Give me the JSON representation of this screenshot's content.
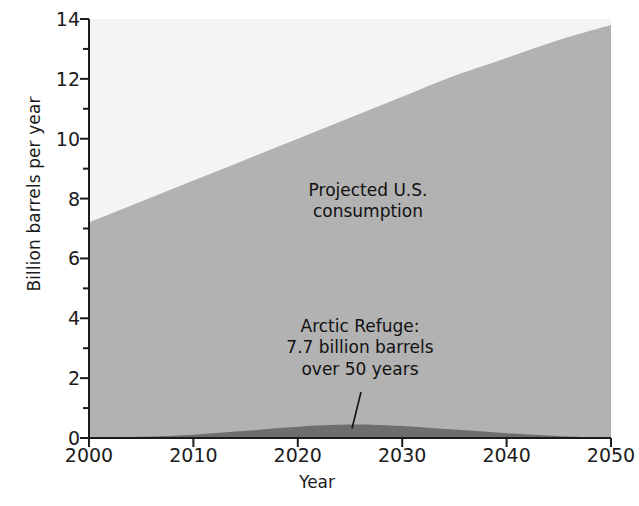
{
  "chart_data": {
    "type": "area",
    "title": "",
    "subtitle": "",
    "xlabel": "Year",
    "ylabel": "Billion barrels per year",
    "xlim": [
      2000,
      2050
    ],
    "ylim": [
      0,
      14
    ],
    "grid": false,
    "legend_position": "none",
    "x_ticks": [
      "2000",
      "2010",
      "2020",
      "2030",
      "2040",
      "2050"
    ],
    "x_tick_values": [
      2000,
      2010,
      2020,
      2030,
      2040,
      2050
    ],
    "x_minor_ticks": [
      2005,
      2015,
      2025,
      2035,
      2045
    ],
    "y_ticks": [
      "0",
      "2",
      "4",
      "6",
      "8",
      "10",
      "12",
      "14"
    ],
    "y_tick_values": [
      0,
      2,
      4,
      6,
      8,
      10,
      12,
      14
    ],
    "y_minor_ticks": [
      1,
      3,
      5,
      7,
      9,
      11,
      13
    ],
    "x": [
      2000,
      2005,
      2010,
      2015,
      2020,
      2025,
      2030,
      2035,
      2040,
      2045,
      2050
    ],
    "series": [
      {
        "name": "Projected U.S. consumption",
        "color": "#b2b2b2",
        "values": [
          7.2,
          7.9,
          8.6,
          9.3,
          10.0,
          10.7,
          11.4,
          12.1,
          12.7,
          13.3,
          13.8
        ]
      },
      {
        "name": "Arctic Refuge: 7.7 billion barrels over 50 years",
        "color": "#6e6e6e",
        "values": [
          0.0,
          0.04,
          0.11,
          0.24,
          0.38,
          0.45,
          0.4,
          0.28,
          0.16,
          0.07,
          0.0
        ]
      }
    ],
    "annotations": [
      {
        "id": "consumption",
        "text": "Projected U.S.\nconsumption",
        "x": 2029,
        "y": 6.7
      },
      {
        "id": "arctic",
        "text": "Arctic Refuge:\n7.7 billion barrels\nover 50 years",
        "x": 2027,
        "y": 3.0,
        "leader_to_x": 2025,
        "leader_to_y": 0.45
      }
    ],
    "colors": {
      "plot_background": "#f4f4f2",
      "consumption_fill": "#b2b2b2",
      "arctic_fill": "#6e6e6e",
      "axis": "#1b1b1b",
      "text": "#1b1b1b"
    }
  }
}
